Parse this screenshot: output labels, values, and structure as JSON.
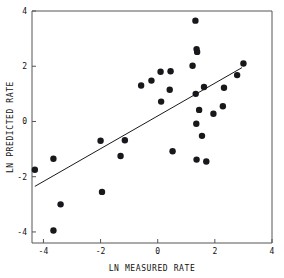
{
  "chart_data": {
    "type": "scatter",
    "title": "",
    "xlabel": "LN MEASURED RATE",
    "ylabel": "LN PREDICTED RATE",
    "xlim": [
      -4.4,
      4.0
    ],
    "ylim": [
      -4.4,
      4.0
    ],
    "xticks": [
      -4,
      -2,
      0,
      2,
      4
    ],
    "yticks": [
      -4,
      -2,
      0,
      2,
      4
    ],
    "xtick_labels": [
      "-4",
      "-2",
      "0",
      "2",
      "4"
    ],
    "ytick_labels": [
      "-4",
      "-2",
      "0",
      "2",
      "4"
    ],
    "grid": false,
    "legend": null,
    "marker_color": "#17171c",
    "line_color": "#1a1a1a",
    "axis_color": "#555555",
    "marker_size": 3.2,
    "series": [
      {
        "name": "observations",
        "type": "scatter",
        "points": [
          [
            -4.3,
            -1.75
          ],
          [
            -3.65,
            -1.35
          ],
          [
            -3.4,
            -3.0
          ],
          [
            -3.65,
            -3.95
          ],
          [
            -2.0,
            -0.7
          ],
          [
            -1.95,
            -2.55
          ],
          [
            -1.3,
            -1.25
          ],
          [
            -1.15,
            -0.68
          ],
          [
            -0.58,
            1.3
          ],
          [
            -0.22,
            1.48
          ],
          [
            0.1,
            1.8
          ],
          [
            0.12,
            0.72
          ],
          [
            0.42,
            1.15
          ],
          [
            0.45,
            1.82
          ],
          [
            0.52,
            -1.08
          ],
          [
            1.22,
            2.02
          ],
          [
            1.32,
            3.65
          ],
          [
            1.36,
            2.62
          ],
          [
            1.38,
            2.52
          ],
          [
            1.33,
            1.0
          ],
          [
            1.35,
            -0.08
          ],
          [
            1.36,
            -1.38
          ],
          [
            1.45,
            0.42
          ],
          [
            1.55,
            -0.52
          ],
          [
            1.62,
            1.25
          ],
          [
            1.7,
            -1.45
          ],
          [
            1.95,
            0.28
          ],
          [
            2.28,
            0.55
          ],
          [
            2.32,
            1.22
          ],
          [
            2.78,
            1.68
          ],
          [
            3.0,
            2.1
          ]
        ]
      },
      {
        "name": "regression-line",
        "type": "line",
        "endpoints": [
          [
            -4.3,
            -2.35
          ],
          [
            2.95,
            1.95
          ]
        ]
      }
    ]
  },
  "figure": {
    "background": "#ffffff",
    "frame": {
      "left": 32,
      "right": 272,
      "top": 11,
      "bottom": 243
    }
  }
}
